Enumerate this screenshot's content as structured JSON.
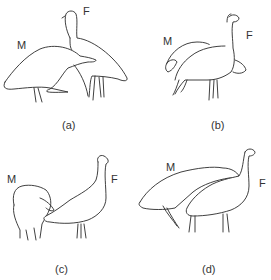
{
  "figure": {
    "panels": [
      {
        "id": "a",
        "caption": "(a)",
        "male_label": "M",
        "female_label": "F",
        "description": "Male (M) in front, body horizontal with head lowered under female's chest; female (F) standing upright behind with neck raised"
      },
      {
        "id": "b",
        "caption": "(b)",
        "male_label": "M",
        "female_label": "F",
        "description": "Male (M) behind female with head lowered; female (F) upright with long neck, male's head visible under female's chest"
      },
      {
        "id": "c",
        "caption": "(c)",
        "male_label": "M",
        "female_label": "F",
        "description": "Male (M) with feathers puffed, head tucked down; female (F) extending neck forward toward male"
      },
      {
        "id": "d",
        "caption": "(d)",
        "male_label": "M",
        "female_label": "F",
        "description": "Male (M) mounting over female's back; female (F) standing with neck raised"
      }
    ],
    "colors": {
      "line": "#2a2a2a",
      "background": "#ffffff",
      "text": "#333333"
    }
  }
}
